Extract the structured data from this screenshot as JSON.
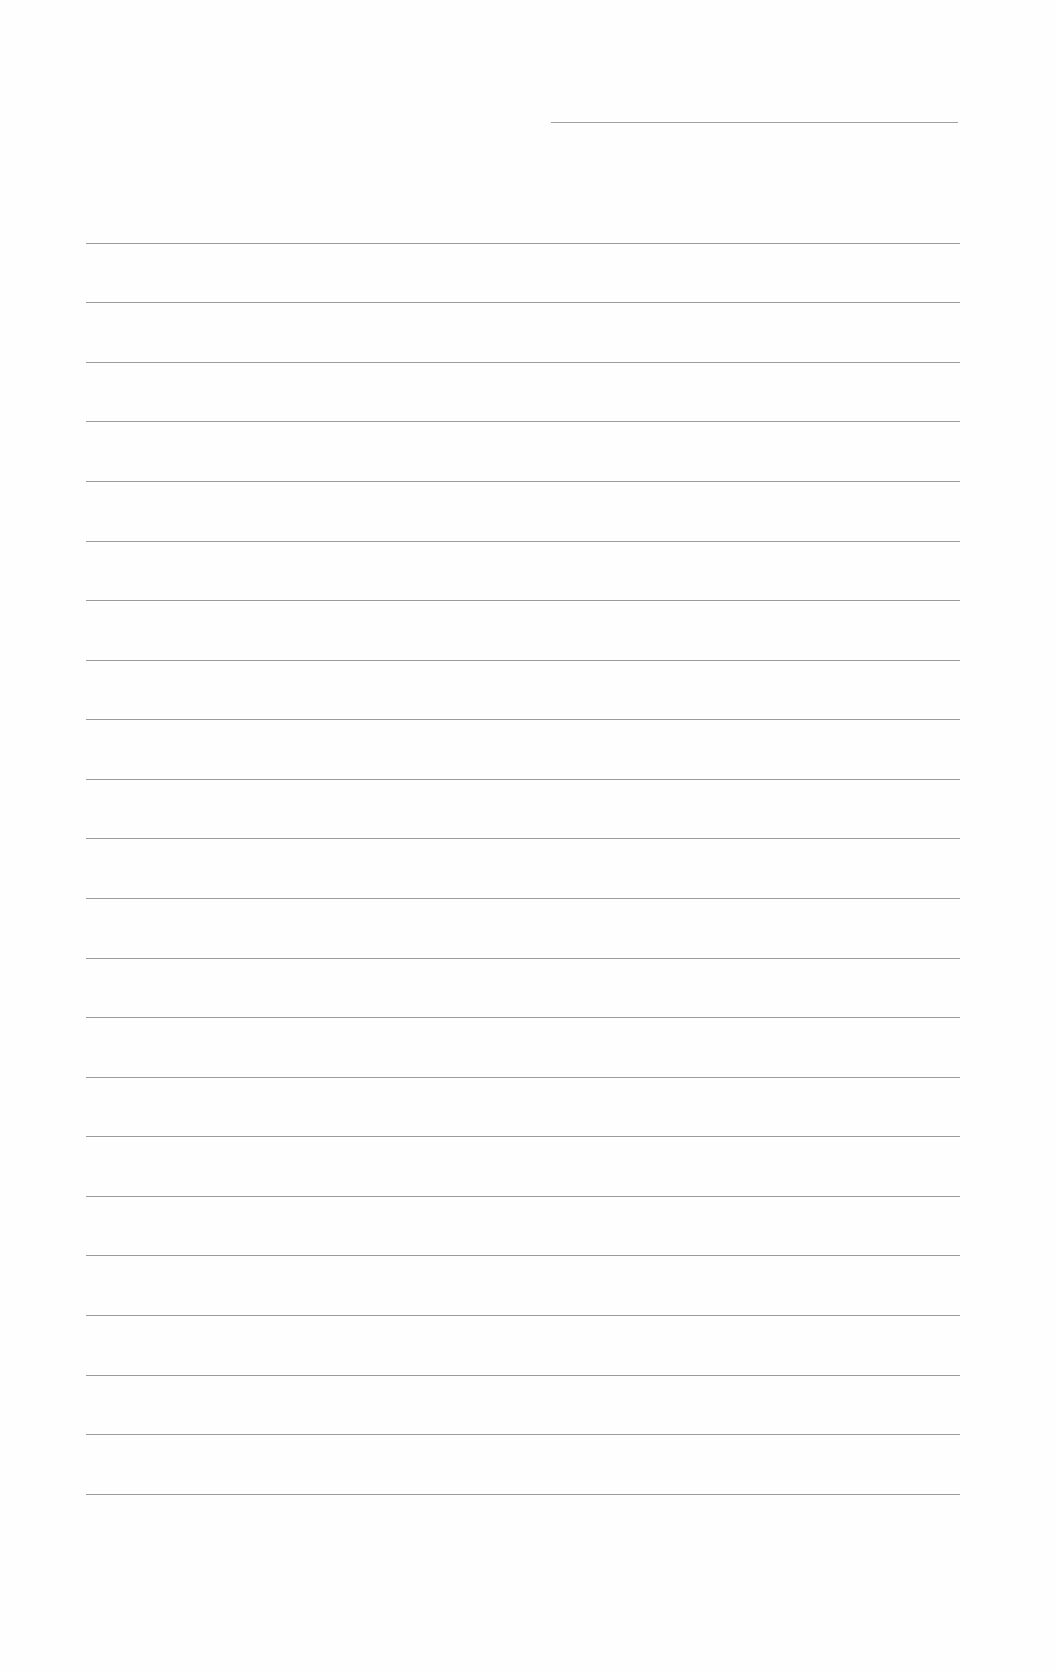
{
  "document": {
    "type": "blank-ruled-sheet",
    "background_color": "#fefefe",
    "rule_color": "#8a8a8a",
    "header_rule": {
      "x1": 551,
      "x2": 958,
      "y": 122
    },
    "body_rules": {
      "x1": 86,
      "x2": 960,
      "ys": [
        243,
        302,
        362,
        421,
        481,
        541,
        600,
        660,
        719,
        779,
        838,
        898,
        958,
        1017,
        1077,
        1136,
        1196,
        1255,
        1315,
        1375,
        1434,
        1494
      ]
    }
  }
}
